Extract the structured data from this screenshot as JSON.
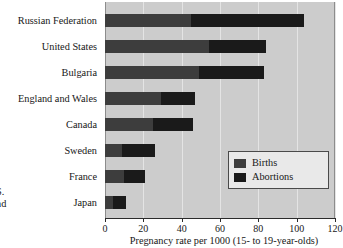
{
  "chart_data": {
    "type": "bar",
    "orientation": "horizontal",
    "stacked": true,
    "title": "",
    "xlabel": "Pregnancy rate per 1000 (15- to 19-year-olds)",
    "ylabel": "",
    "xlim": [
      0,
      120
    ],
    "xticks": [
      0,
      20,
      40,
      60,
      80,
      100,
      120
    ],
    "xtick_labels": [
      "0",
      "20",
      "40",
      "60",
      "80",
      "100",
      "120"
    ],
    "grid": true,
    "legend_position": "lower right",
    "categories": [
      "Russian Federation",
      "United States",
      "Bulgaria",
      "England and Wales",
      "Canada",
      "Sweden",
      "France",
      "Japan"
    ],
    "series": [
      {
        "name": "Births",
        "color": "#3d3d3d",
        "values": [
          45,
          54,
          49,
          29,
          25,
          9,
          10,
          4
        ]
      },
      {
        "name": "Abortions",
        "color": "#1a1a1a",
        "values": [
          59,
          30,
          34,
          18,
          21,
          17,
          11,
          7
        ]
      }
    ],
    "totals": [
      104,
      84,
      83,
      47,
      46,
      26,
      21,
      11
    ]
  },
  "legend": {
    "items": [
      {
        "label": "Births",
        "color": "#3d3d3d"
      },
      {
        "label": "Abortions",
        "color": "#1a1a1a"
      }
    ]
  },
  "margin_note": {
    "line1": "S.",
    "line2": "nd"
  },
  "colors": {
    "plot_background": "#cccccc",
    "gridline": "#e4e4e4",
    "axis": "#2b2b2b",
    "text": "#171717",
    "legend_background": "#e9e9e9",
    "legend_border": "#4a4a4a"
  }
}
